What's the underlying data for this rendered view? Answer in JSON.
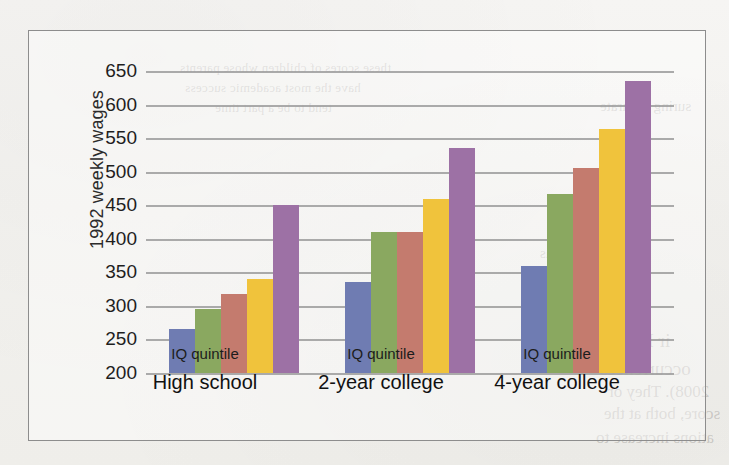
{
  "chart_data": {
    "type": "bar",
    "title": "",
    "xlabel": "IQ quintile",
    "ylabel": "1992 weekly wages",
    "ylim": [
      200,
      650
    ],
    "ytick_step": 50,
    "yticks": [
      650,
      600,
      550,
      500,
      450,
      400,
      350,
      300,
      250,
      200
    ],
    "grid": true,
    "legend": "none",
    "categories": [
      "High school",
      "2-year college",
      "4-year college"
    ],
    "group_sublabel": "IQ quintile",
    "series": [
      {
        "name": "1st quintile",
        "color": "#6f7cb2",
        "values": [
          265,
          335,
          360
        ]
      },
      {
        "name": "2nd quintile",
        "color": "#8aa860",
        "values": [
          295,
          410,
          467
        ]
      },
      {
        "name": "3rd quintile",
        "color": "#c47b6e",
        "values": [
          318,
          410,
          505
        ]
      },
      {
        "name": "4th quintile",
        "color": "#f0c33c",
        "values": [
          340,
          460,
          563
        ]
      },
      {
        "name": "5th quintile",
        "color": "#9d71a5",
        "values": [
          450,
          535,
          635
        ]
      }
    ]
  },
  "axis": {
    "y_title": "1992 weekly wages",
    "y_labels": [
      "650",
      "600",
      "550",
      "500",
      "450",
      "400",
      "350",
      "300",
      "250",
      "200"
    ],
    "groups": [
      {
        "sub": "IQ quintile",
        "main": "High school"
      },
      {
        "sub": "IQ quintile",
        "main": "2-year college"
      },
      {
        "sub": "IQ quintile",
        "main": "4-year college"
      }
    ]
  },
  "bleed_through": {
    "line1": "these scores of children whose parents",
    "line2": "have the most academic success",
    "line3": "tend to be a part time",
    "line4": "suring accurate",
    "line5": "prepared as",
    "line6": "ir F. Ho",
    "line7": "occurrences",
    "line8": "2008). They or",
    "line9": "score, both at the",
    "line10": "ations increase to"
  }
}
